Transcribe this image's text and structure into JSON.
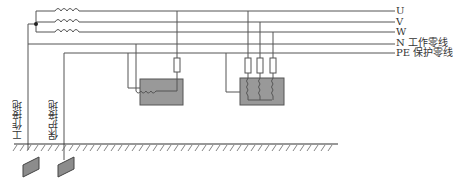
{
  "diagram": {
    "colors": {
      "line": "#555555",
      "equipment_fill": "#999999",
      "fuse_fill": "#ffffff",
      "ground_hatch": "#555555",
      "electrode_fill": "#8c8c8c"
    },
    "lines": [
      {
        "id": "U",
        "label": "U",
        "y": 11
      },
      {
        "id": "V",
        "label": "V",
        "y": 22
      },
      {
        "id": "W",
        "label": "W",
        "y": 32
      },
      {
        "id": "N",
        "label": "N 工作零线",
        "y": 43
      },
      {
        "id": "PE",
        "label": "PE 保护零线",
        "y": 53
      }
    ],
    "earth_labels": {
      "working": "工作接地",
      "protective": "保护接地"
    },
    "components": {
      "transformer_coils": 3,
      "single_phase_load": {
        "fuses": 1
      },
      "three_phase_load": {
        "fuses": 3
      }
    }
  }
}
